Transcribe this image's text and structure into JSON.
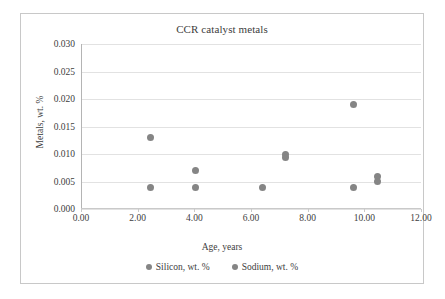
{
  "chart_data": {
    "type": "scatter",
    "title": "CCR catalyst metals",
    "xlabel": "Age, years",
    "ylabel": "Metals, wt. %",
    "xlim": [
      0,
      12
    ],
    "ylim": [
      0,
      0.03
    ],
    "xticks": [
      "0.00",
      "2.00",
      "4.00",
      "6.00",
      "8.00",
      "10.00",
      "12.00"
    ],
    "xtick_values": [
      0,
      2,
      4,
      6,
      8,
      10,
      12
    ],
    "yticks": [
      "0.000",
      "0.005",
      "0.010",
      "0.015",
      "0.020",
      "0.025",
      "0.030"
    ],
    "ytick_values": [
      0,
      0.005,
      0.01,
      0.015,
      0.02,
      0.025,
      0.03
    ],
    "grid": true,
    "legend_position": "bottom",
    "marker_color": "#858585",
    "series": [
      {
        "name": "Silicon, wt. %",
        "points": [
          {
            "x": 2.45,
            "y": 0.013
          },
          {
            "x": 4.05,
            "y": 0.007
          },
          {
            "x": 7.2,
            "y": 0.01
          },
          {
            "x": 9.6,
            "y": 0.019
          },
          {
            "x": 10.45,
            "y": 0.006
          }
        ]
      },
      {
        "name": "Sodium, wt. %",
        "points": [
          {
            "x": 2.45,
            "y": 0.004
          },
          {
            "x": 4.05,
            "y": 0.004
          },
          {
            "x": 6.4,
            "y": 0.004
          },
          {
            "x": 7.2,
            "y": 0.0093
          },
          {
            "x": 9.6,
            "y": 0.004
          },
          {
            "x": 10.45,
            "y": 0.005
          }
        ]
      }
    ]
  },
  "legend": {
    "items": [
      {
        "label": "Silicon, wt. %"
      },
      {
        "label": "Sodium, wt. %"
      }
    ]
  }
}
